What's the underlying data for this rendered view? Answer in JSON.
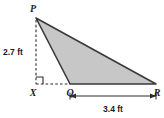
{
  "figure": {
    "name": "triangle-pqr-with-altitude",
    "background_color": "#ffffff",
    "shape": {
      "type": "triangle",
      "fill_color": "#c7c7c7",
      "stroke_color": "#3a3a3a",
      "vertices": [
        {
          "label": "P",
          "x": 36,
          "y": 18
        },
        {
          "label": "Q",
          "x": 70,
          "y": 84
        },
        {
          "label": "R",
          "x": 156,
          "y": 84
        }
      ]
    },
    "foot_point": {
      "label": "X",
      "x": 36,
      "y": 84
    },
    "labels": {
      "p": "P",
      "q": "Q",
      "r": "R",
      "x": "X"
    },
    "measurements": {
      "height": "2.7 ft",
      "base": "3.4 ft"
    },
    "construction": {
      "altitude_line": "dashed",
      "base_extension_line": "dashed",
      "right_angle_marker": true,
      "dimension_line_position": "below-base"
    }
  }
}
